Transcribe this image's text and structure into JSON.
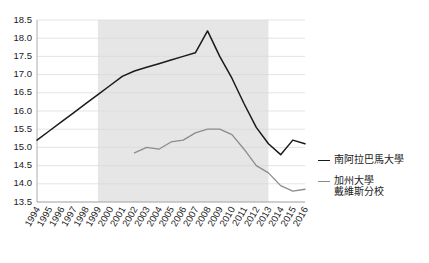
{
  "chart_data": {
    "type": "line",
    "title": "",
    "subtitle": "",
    "xlabel": "",
    "ylabel": "",
    "x": [
      1994,
      1995,
      1996,
      1997,
      1998,
      1999,
      2000,
      2001,
      2002,
      2003,
      2004,
      2005,
      2006,
      2007,
      2008,
      2009,
      2010,
      2011,
      2012,
      2013,
      2014,
      2015,
      2016
    ],
    "xtick_labels": [
      "1994",
      "1995",
      "1996",
      "1997",
      "1998",
      "1999",
      "2000",
      "2001",
      "2002",
      "2003",
      "2004",
      "2005",
      "2006",
      "2007",
      "2008",
      "2009",
      "2010",
      "2011",
      "2012",
      "2013",
      "2014",
      "2015",
      "2016"
    ],
    "ytick_labels": [
      "13.5",
      "14.0",
      "14.5",
      "15.0",
      "15.5",
      "16.0",
      "16.5",
      "17.0",
      "17.5",
      "18.0",
      "18.5"
    ],
    "ytick_values": [
      13.5,
      14.0,
      14.5,
      15.0,
      15.5,
      16.0,
      16.5,
      17.0,
      17.5,
      18.0,
      18.5
    ],
    "ylim": [
      13.5,
      18.5
    ],
    "xlim": [
      1994,
      2016
    ],
    "grid": true,
    "legend_position": "right",
    "shaded_band": {
      "start": 1999,
      "end": 2013,
      "color": "#e6e6e6"
    },
    "series": [
      {
        "name": "南阿拉巴馬大學",
        "color": "#1a1a1a",
        "values": [
          15.2,
          15.45,
          15.7,
          15.95,
          16.2,
          16.45,
          16.7,
          16.95,
          17.1,
          17.2,
          17.3,
          17.4,
          17.5,
          17.6,
          18.2,
          17.5,
          16.9,
          16.2,
          15.55,
          15.1,
          14.8,
          15.2,
          15.1
        ]
      },
      {
        "name": "加州大學戴維斯分校",
        "color": "#8c8c8c",
        "values": [
          null,
          null,
          null,
          null,
          null,
          null,
          null,
          null,
          14.85,
          15.0,
          14.95,
          15.15,
          15.2,
          15.4,
          15.5,
          15.5,
          15.35,
          14.95,
          14.5,
          14.3,
          13.95,
          13.8,
          13.85
        ]
      }
    ]
  },
  "legend": {
    "entries": [
      {
        "label": "南阿拉巴馬大學",
        "color": "#1a1a1a"
      },
      {
        "label": "加州大學\n戴維斯分校",
        "color": "#8c8c8c"
      }
    ]
  }
}
